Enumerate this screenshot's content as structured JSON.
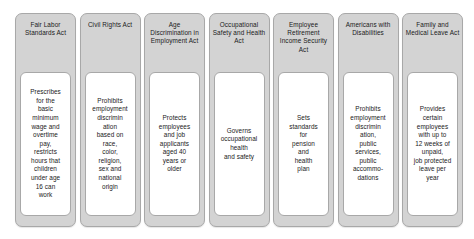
{
  "diagram": {
    "type": "employment-law-overview",
    "colors": {
      "card_background": "#d3d3d3",
      "card_border": "#a8a8a8",
      "body_background": "#ffffff",
      "text": "#1a1a1a",
      "page_background": "#ffffff"
    },
    "cards": [
      {
        "title": "Fair Labor\nStandards Act",
        "description": "Prescribes\nfor the\nbasic\nminimum\nwage and\novertime\npay,\nrestricts\nhours that\nchildren\nunder age\n16 can\nwork"
      },
      {
        "title": "Civil Rights Act",
        "description": "Prohibits\nemployment\ndiscrimin\nation\nbased on\nrace,\ncolor,\nreligion,\nsex and\nnational\norigin"
      },
      {
        "title": "Age\nDiscrimination\nin Employment\nAct",
        "description": "Protects\nemployees\nand job\napplicants\naged 40\nyears or\nolder"
      },
      {
        "title": "Occupational\nSafety and\nHealth Act",
        "description": "Governs\noccupational\nhealth\nand safety"
      },
      {
        "title": "Employee\nRetirement\nIncome\nSecurity Act",
        "description": "Sets\nstandards\nfor\npension\nand\nhealth\nplan"
      },
      {
        "title": "Americans\nwith\nDisabilities",
        "description": "Prohibits\nemployment\ndiscrimin\nation,\npublic\nservices,\npublic\naccommo-\ndations"
      },
      {
        "title": "Family and\nMedical Leave\nAct",
        "description": "Provides\ncertain\nemployees\nwith up to\n12 weeks of\nunpaid,\njob protected\nleave per\nyear"
      }
    ]
  }
}
